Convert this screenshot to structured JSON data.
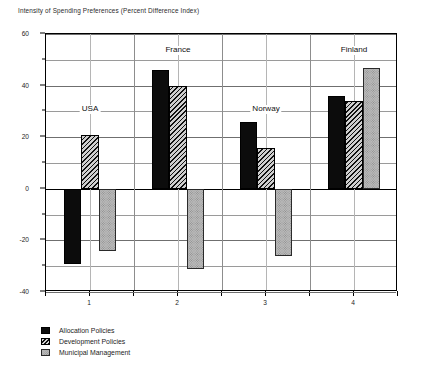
{
  "chart_data": {
    "type": "bar",
    "title": "Intensity of Spending Preferences (Percent Difference Index)",
    "xlabel": "",
    "ylabel": "",
    "categories": [
      "1",
      "2",
      "3",
      "4"
    ],
    "ylim": [
      -40,
      60
    ],
    "ytick_labels": [
      "-40",
      "-20",
      "0",
      "20",
      "40",
      "60"
    ],
    "ytick_values": [
      -40,
      -20,
      0,
      20,
      40,
      60
    ],
    "minor_ytick_values": [
      -30,
      -10,
      10,
      30,
      50
    ],
    "grid": true,
    "legend_position": "below-left",
    "series": [
      {
        "name": "Allocation Policies",
        "key": "s0",
        "color": "#0c0c0c",
        "pattern": "solid-black",
        "values": [
          -29,
          46,
          26,
          36
        ]
      },
      {
        "name": "Development Policies",
        "key": "s1",
        "color": "#cfcfcf",
        "pattern": "diagonal-hatch",
        "values": [
          21,
          40,
          16,
          34
        ]
      },
      {
        "name": "Municipal Management",
        "key": "s2",
        "color": "#b9b9b9",
        "pattern": "stipple-gray",
        "values": [
          -24,
          -31,
          -26,
          47
        ]
      }
    ],
    "annotations": [
      {
        "text": "USA",
        "category": "1",
        "value": 30
      },
      {
        "text": "France",
        "category": "2",
        "value": 53
      },
      {
        "text": "Norway",
        "category": "3",
        "value": 30
      },
      {
        "text": "Finland",
        "category": "4",
        "value": 53
      }
    ]
  }
}
